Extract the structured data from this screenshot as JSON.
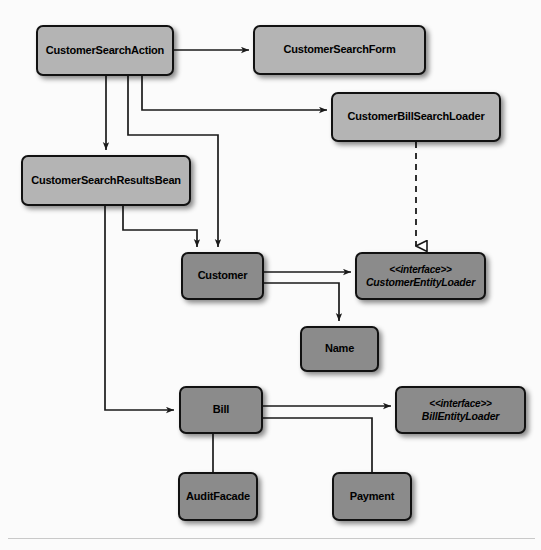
{
  "diagram": {
    "colors": {
      "background": "#fbfbfb",
      "node_light_fill": "#b4b4b4",
      "node_dark_fill": "#8b8b8b",
      "node_border": "#111111",
      "edge": "#1a1a1a",
      "rule": "#c9c9c9"
    },
    "nodes": [
      {
        "id": "customer-search-action",
        "label": "CustomerSearchAction",
        "kind": "class",
        "shade": "light",
        "x": 36,
        "y": 25,
        "w": 138,
        "h": 51
      },
      {
        "id": "customer-search-form",
        "label": "CustomerSearchForm",
        "kind": "class",
        "shade": "light",
        "x": 253,
        "y": 25,
        "w": 173,
        "h": 50
      },
      {
        "id": "customer-bill-search-loader",
        "label": "CustomerBillSearchLoader",
        "kind": "class",
        "shade": "light",
        "x": 331,
        "y": 92,
        "w": 170,
        "h": 50
      },
      {
        "id": "customer-search-results-bean",
        "label": "CustomerSearchResultsBean",
        "kind": "class",
        "shade": "light",
        "x": 21,
        "y": 155,
        "w": 170,
        "h": 51
      },
      {
        "id": "customer",
        "label": "Customer",
        "kind": "class",
        "shade": "dark",
        "x": 181,
        "y": 252,
        "w": 83,
        "h": 48
      },
      {
        "id": "customer-entity-loader",
        "label": "CustomerEntityLoader",
        "stereotype": "<<interface>>",
        "kind": "interface",
        "shade": "dark",
        "x": 355,
        "y": 252,
        "w": 131,
        "h": 48
      },
      {
        "id": "name",
        "label": "Name",
        "kind": "class",
        "shade": "dark",
        "x": 300,
        "y": 326,
        "w": 79,
        "h": 46
      },
      {
        "id": "bill",
        "label": "Bill",
        "kind": "class",
        "shade": "dark",
        "x": 179,
        "y": 386,
        "w": 84,
        "h": 48
      },
      {
        "id": "bill-entity-loader",
        "label": "BillEntityLoader",
        "stereotype": "<<interface>>",
        "kind": "interface",
        "shade": "dark",
        "x": 395,
        "y": 386,
        "w": 131,
        "h": 48
      },
      {
        "id": "audit-facade",
        "label": "AuditFacade",
        "kind": "class",
        "shade": "dark",
        "x": 178,
        "y": 472,
        "w": 80,
        "h": 49
      },
      {
        "id": "payment",
        "label": "Payment",
        "kind": "class",
        "shade": "dark",
        "x": 332,
        "y": 472,
        "w": 80,
        "h": 49
      }
    ],
    "edges": [
      {
        "id": "e-action-form",
        "from": "customer-search-action",
        "to": "customer-search-form",
        "style": "solid",
        "arrow": "open"
      },
      {
        "id": "e-action-billloader",
        "from": "customer-search-action",
        "to": "customer-bill-search-loader",
        "style": "solid",
        "arrow": "open"
      },
      {
        "id": "e-action-resultsbean",
        "from": "customer-search-action",
        "to": "customer-search-results-bean",
        "style": "solid",
        "arrow": "open"
      },
      {
        "id": "e-action-customer",
        "from": "customer-search-action",
        "to": "customer",
        "style": "solid",
        "arrow": "open"
      },
      {
        "id": "e-resultsbean-customer",
        "from": "customer-search-results-bean",
        "to": "customer",
        "style": "solid",
        "arrow": "open"
      },
      {
        "id": "e-resultsbean-bill",
        "from": "customer-search-results-bean",
        "to": "bill",
        "style": "solid",
        "arrow": "open"
      },
      {
        "id": "e-billloader-customerentityloader",
        "from": "customer-bill-search-loader",
        "to": "customer-entity-loader",
        "style": "dashed",
        "arrow": "hollow-triangle"
      },
      {
        "id": "e-customer-entityloader",
        "from": "customer",
        "to": "customer-entity-loader",
        "style": "solid",
        "arrow": "open"
      },
      {
        "id": "e-customer-name",
        "from": "customer",
        "to": "name",
        "style": "solid",
        "arrow": "open"
      },
      {
        "id": "e-bill-billentityloader",
        "from": "bill",
        "to": "bill-entity-loader",
        "style": "solid",
        "arrow": "open"
      },
      {
        "id": "e-bill-auditfacade",
        "from": "bill",
        "to": "audit-facade",
        "style": "solid",
        "arrow": "none"
      },
      {
        "id": "e-bill-payment",
        "from": "bill",
        "to": "payment",
        "style": "solid",
        "arrow": "none"
      }
    ]
  }
}
